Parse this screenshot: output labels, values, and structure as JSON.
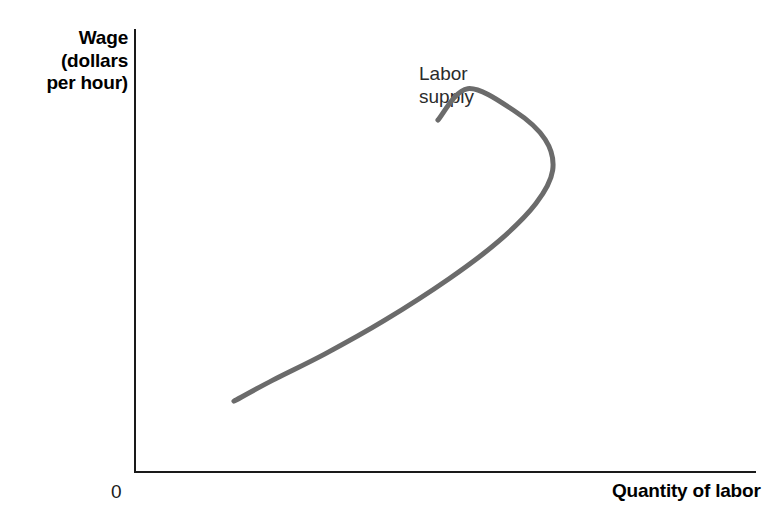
{
  "figure": {
    "background_color": "#ffffff",
    "width": 781,
    "height": 527
  },
  "axes": {
    "origin_label": "0",
    "axis_color": "#1a1a1a",
    "y_axis_label_lines": [
      "Wage",
      "(dollars",
      "per hour)"
    ],
    "y_axis_label_full": "Wage (dollars per hour)",
    "x_axis_label": "Quantity of labor"
  },
  "annotations": [
    {
      "name": "labor-supply-curve-label",
      "lines": [
        "Labor",
        "supply"
      ],
      "text": "Labor supply",
      "color": "#2b2b2b"
    }
  ],
  "chart_data": {
    "type": "line",
    "title": "",
    "subtitle": "",
    "xlabel": "Quantity of labor",
    "ylabel": "Wage (dollars per hour)",
    "xlim": [
      0,
      100
    ],
    "ylim": [
      0,
      100
    ],
    "grid": false,
    "legend": false,
    "axis_tick_labels": {
      "x": [],
      "y": []
    },
    "origin_label": "0",
    "series": [
      {
        "name": "Labor supply",
        "label": "Labor supply",
        "color": "#6b6b6b",
        "line_width": 5,
        "description": "Backward-bending labor supply curve: quantity of labor rises with the wage at low wages, reaches a maximum, then falls as the wage rises further.",
        "shape": "backward-bending",
        "points": [
          {
            "x": 15.8,
            "y": 15.8
          },
          {
            "x": 22.0,
            "y": 20.5
          },
          {
            "x": 30.5,
            "y": 26.5
          },
          {
            "x": 40.0,
            "y": 34.0
          },
          {
            "x": 50.5,
            "y": 43.5
          },
          {
            "x": 58.5,
            "y": 52.0
          },
          {
            "x": 64.5,
            "y": 60.5
          },
          {
            "x": 67.2,
            "y": 68.0
          },
          {
            "x": 66.0,
            "y": 75.0
          },
          {
            "x": 61.0,
            "y": 81.5
          },
          {
            "x": 53.5,
            "y": 86.5
          },
          {
            "x": 48.7,
            "y": 79.4
          }
        ],
        "max_quantity_point": {
          "x": 67.2,
          "y": 55.0
        },
        "lower_endpoint": {
          "x": 15.8,
          "y": 15.8
        },
        "upper_endpoint": {
          "x": 48.7,
          "y": 79.4
        }
      }
    ],
    "pixel_path": {
      "start": [
        233,
        402
      ],
      "bend_max_x": [
        551,
        228
      ],
      "end": [
        437,
        120
      ]
    }
  }
}
